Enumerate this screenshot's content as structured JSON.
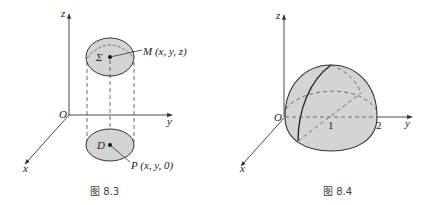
{
  "figures": [
    {
      "id": "fig-8-3",
      "caption": "图 8.3",
      "axes": {
        "x": "x",
        "y": "y",
        "z": "z",
        "origin": "O"
      },
      "surface_label": "Σ",
      "region_label": "D",
      "point_M": "M (x, y, z)",
      "point_P": "P (x, y, 0)"
    },
    {
      "id": "fig-8-4",
      "caption": "图 8.4",
      "axes": {
        "x": "x",
        "y": "y",
        "z": "z",
        "origin": "O"
      },
      "tick_1": "1",
      "tick_2": "2"
    }
  ],
  "colors": {
    "fill": "#d4d4d4",
    "stroke": "#333333",
    "background": "#ffffff"
  }
}
